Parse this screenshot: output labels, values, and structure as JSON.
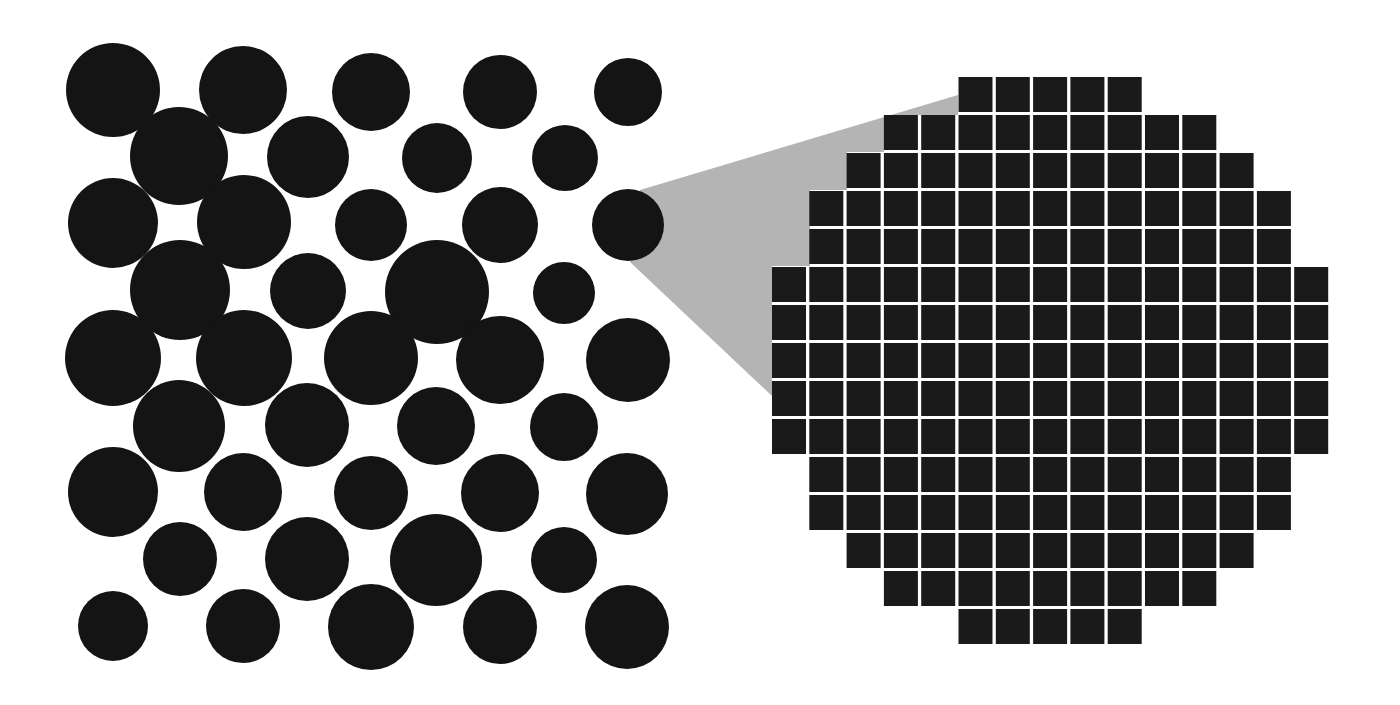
{
  "figure": {
    "colors": {
      "background": "#ffffff",
      "circle": "#141414",
      "magnify_wedge": "#b4b4b4",
      "pixel": "#1a1a1a",
      "grid_gap": "#ffffff"
    }
  },
  "circles": [
    {
      "cx": 113,
      "cy": 90,
      "r": 47
    },
    {
      "cx": 243,
      "cy": 90,
      "r": 44
    },
    {
      "cx": 371,
      "cy": 92,
      "r": 39
    },
    {
      "cx": 500,
      "cy": 92,
      "r": 37
    },
    {
      "cx": 628,
      "cy": 92,
      "r": 34
    },
    {
      "cx": 179,
      "cy": 156,
      "r": 49
    },
    {
      "cx": 308,
      "cy": 157,
      "r": 41
    },
    {
      "cx": 437,
      "cy": 158,
      "r": 35
    },
    {
      "cx": 565,
      "cy": 158,
      "r": 33
    },
    {
      "cx": 113,
      "cy": 223,
      "r": 45
    },
    {
      "cx": 244,
      "cy": 222,
      "r": 47
    },
    {
      "cx": 371,
      "cy": 225,
      "r": 36
    },
    {
      "cx": 500,
      "cy": 225,
      "r": 38
    },
    {
      "cx": 628,
      "cy": 225,
      "r": 36,
      "magnified": true
    },
    {
      "cx": 180,
      "cy": 290,
      "r": 50
    },
    {
      "cx": 308,
      "cy": 291,
      "r": 38
    },
    {
      "cx": 437,
      "cy": 292,
      "r": 52
    },
    {
      "cx": 564,
      "cy": 293,
      "r": 31
    },
    {
      "cx": 113,
      "cy": 358,
      "r": 48
    },
    {
      "cx": 244,
      "cy": 358,
      "r": 48
    },
    {
      "cx": 371,
      "cy": 358,
      "r": 47
    },
    {
      "cx": 500,
      "cy": 360,
      "r": 44
    },
    {
      "cx": 628,
      "cy": 360,
      "r": 42
    },
    {
      "cx": 179,
      "cy": 426,
      "r": 46
    },
    {
      "cx": 307,
      "cy": 425,
      "r": 42
    },
    {
      "cx": 436,
      "cy": 426,
      "r": 39
    },
    {
      "cx": 564,
      "cy": 427,
      "r": 34
    },
    {
      "cx": 113,
      "cy": 492,
      "r": 45
    },
    {
      "cx": 243,
      "cy": 492,
      "r": 39
    },
    {
      "cx": 371,
      "cy": 493,
      "r": 37
    },
    {
      "cx": 500,
      "cy": 493,
      "r": 39
    },
    {
      "cx": 627,
      "cy": 494,
      "r": 41
    },
    {
      "cx": 180,
      "cy": 559,
      "r": 37
    },
    {
      "cx": 307,
      "cy": 559,
      "r": 42
    },
    {
      "cx": 436,
      "cy": 560,
      "r": 46
    },
    {
      "cx": 564,
      "cy": 560,
      "r": 33
    },
    {
      "cx": 113,
      "cy": 626,
      "r": 35
    },
    {
      "cx": 243,
      "cy": 626,
      "r": 37
    },
    {
      "cx": 371,
      "cy": 627,
      "r": 43
    },
    {
      "cx": 500,
      "cy": 627,
      "r": 37
    },
    {
      "cx": 627,
      "cy": 627,
      "r": 42
    }
  ],
  "wedge": {
    "points": [
      [
        640,
        190
      ],
      [
        958,
        95
      ],
      [
        958,
        115
      ],
      [
        884,
        115
      ],
      [
        884,
        152
      ],
      [
        847,
        152
      ],
      [
        847,
        190
      ],
      [
        810,
        190
      ],
      [
        810,
        266
      ],
      [
        772,
        266
      ],
      [
        772,
        396
      ],
      [
        630,
        262
      ]
    ]
  },
  "pixel_grid": {
    "origin_x": 772,
    "origin_y": 77,
    "pitch_x": 37.3,
    "pitch_y": 38.0,
    "cell_w": 34,
    "cell_h": 35,
    "rows": [
      {
        "row": 0,
        "from_col": 5,
        "to_col": 9
      },
      {
        "row": 1,
        "from_col": 3,
        "to_col": 11
      },
      {
        "row": 2,
        "from_col": 2,
        "to_col": 12
      },
      {
        "row": 3,
        "from_col": 1,
        "to_col": 13
      },
      {
        "row": 4,
        "from_col": 1,
        "to_col": 13
      },
      {
        "row": 5,
        "from_col": 0,
        "to_col": 14
      },
      {
        "row": 6,
        "from_col": 0,
        "to_col": 14
      },
      {
        "row": 7,
        "from_col": 0,
        "to_col": 14
      },
      {
        "row": 8,
        "from_col": 0,
        "to_col": 14
      },
      {
        "row": 9,
        "from_col": 0,
        "to_col": 14
      },
      {
        "row": 10,
        "from_col": 1,
        "to_col": 13
      },
      {
        "row": 11,
        "from_col": 1,
        "to_col": 13
      },
      {
        "row": 12,
        "from_col": 2,
        "to_col": 12
      },
      {
        "row": 13,
        "from_col": 3,
        "to_col": 11
      },
      {
        "row": 14,
        "from_col": 5,
        "to_col": 9
      }
    ]
  }
}
